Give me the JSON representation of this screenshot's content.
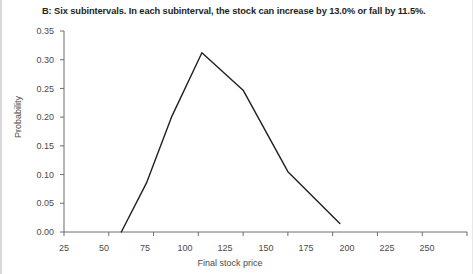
{
  "figure": {
    "panel_label": "B",
    "title": "B: Six subintervals. In each subinterval, the stock can increase by 13.0% or fall by 11.5%.",
    "background_color": "#ffffff",
    "line_color": "#231f20",
    "text_color": "#4b4b4b"
  },
  "chart_data": {
    "type": "line",
    "title": "B: Six subintervals. In each subinterval, the stock can increase by 13.0% or fall by 11.5%.",
    "xlabel": "Final stock price",
    "ylabel": "Probability",
    "xlim": [
      25,
      250
    ],
    "ylim": [
      0.0,
      0.35
    ],
    "xticks": [
      25,
      50,
      75,
      100,
      125,
      150,
      175,
      200,
      225,
      250
    ],
    "xtick_labels": [
      "25",
      "50",
      "75",
      "100",
      "125",
      "150",
      "175",
      "200",
      "225",
      "250"
    ],
    "yticks": [
      0.0,
      0.05,
      0.1,
      0.15,
      0.2,
      0.25,
      0.3,
      0.35
    ],
    "ytick_labels": [
      "0.00",
      "0.05",
      "0.10",
      "0.15",
      "0.20",
      "0.25",
      "0.30",
      "0.35"
    ],
    "grid": false,
    "legend": false,
    "series": [
      {
        "name": "Probability of final stock price",
        "x": [
          57,
          71,
          85,
          102,
          125,
          150,
          179
        ],
        "values": [
          0.0,
          0.085,
          0.2,
          0.312,
          0.247,
          0.105,
          0.015
        ]
      }
    ]
  }
}
